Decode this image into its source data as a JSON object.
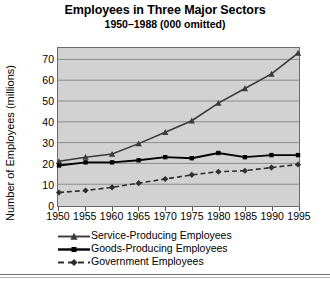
{
  "chart_data": {
    "type": "line",
    "title": "Employees in Three Major Sectors",
    "subtitle": "1950–1988 (000 omitted)",
    "xlabel": "",
    "ylabel": "Number of Employees (millions)",
    "x": [
      1950,
      1955,
      1960,
      1965,
      1970,
      1975,
      1980,
      1985,
      1990,
      1995
    ],
    "categories": [
      "1950",
      "1955",
      "1960",
      "1965",
      "1970",
      "1975",
      "1980",
      "1985",
      "1990",
      "1995"
    ],
    "xlim": [
      1950,
      1995
    ],
    "ylim": [
      0,
      75
    ],
    "yticks": [
      0,
      10,
      20,
      30,
      40,
      50,
      60,
      70
    ],
    "grid": true,
    "legend_position": "bottom-left",
    "series": [
      {
        "name": "Service-Producing Employees",
        "marker": "triangle",
        "linestyle": "solid",
        "color": "#3a3a3a",
        "values": [
          21,
          23,
          24.5,
          29.5,
          35,
          40.5,
          49,
          56,
          63,
          73
        ]
      },
      {
        "name": "Goods-Producing Employees",
        "marker": "square",
        "linestyle": "solid",
        "color": "#000000",
        "values": [
          19,
          20.5,
          20.5,
          21.5,
          23,
          22.5,
          25,
          23,
          24,
          24
        ]
      },
      {
        "name": "Government Employees",
        "marker": "diamond",
        "linestyle": "dashed",
        "color": "#2e2e2e",
        "values": [
          6,
          7,
          8.5,
          10.5,
          12.5,
          14.5,
          16,
          16.5,
          18,
          19.5
        ]
      }
    ]
  },
  "legend": {
    "items": [
      {
        "label": "Service-Producing Employees"
      },
      {
        "label": "Goods-Producing Employees"
      },
      {
        "label": "Government Employees"
      }
    ]
  },
  "colors": {
    "plot_background": "#d2d2d2",
    "gridline": "#8a8a8a",
    "frame": "#6a6a6a",
    "page_background": "#ffffff"
  }
}
